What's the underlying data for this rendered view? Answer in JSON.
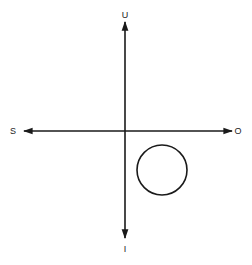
{
  "diagram": {
    "type": "axes-with-circle",
    "labels": {
      "up": "U",
      "down": "I",
      "left": "S",
      "right": "O"
    },
    "colors": {
      "stroke": "#1a1a1a",
      "background": "#ffffff"
    },
    "circle": {
      "quadrant": "lower-right"
    }
  }
}
